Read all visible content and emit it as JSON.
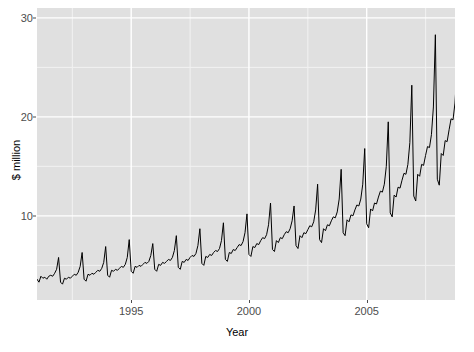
{
  "chart_data": {
    "type": "line",
    "title": "",
    "subtitle": "",
    "xlabel": "Year",
    "ylabel": "$ million",
    "xlim": [
      1991.0,
      2008.75
    ],
    "ylim": [
      1.5,
      31.0
    ],
    "xticks": [
      1995,
      2000,
      2005
    ],
    "xtick_labels": [
      "1995",
      "2000",
      "2005"
    ],
    "yticks": [
      10,
      20,
      30
    ],
    "ytick_labels": [
      "10",
      "20",
      "30"
    ],
    "grid": true,
    "grid_major_color": "#ffffff",
    "grid_minor_color": "#f2f2f2",
    "panel_background": "#e0e0e0",
    "line_color": "#000000",
    "line_width": 1.0,
    "legend": "none",
    "series": [
      {
        "name": "monthly total",
        "x_start": 1991.0,
        "x_step": 0.08333,
        "values": [
          3.6,
          3.3,
          3.9,
          3.7,
          3.8,
          3.6,
          3.9,
          4.0,
          3.9,
          4.2,
          4.6,
          5.8,
          3.3,
          3.1,
          3.7,
          3.6,
          3.8,
          3.7,
          3.9,
          4.1,
          4.0,
          4.3,
          4.9,
          6.3,
          3.6,
          3.4,
          4.1,
          4.0,
          4.2,
          4.1,
          4.3,
          4.5,
          4.4,
          4.7,
          5.3,
          6.9,
          4.0,
          3.8,
          4.5,
          4.4,
          4.6,
          4.5,
          4.7,
          4.9,
          4.8,
          5.1,
          5.8,
          7.6,
          4.4,
          4.2,
          4.9,
          4.8,
          5.0,
          4.9,
          5.1,
          5.3,
          5.2,
          5.4,
          6.0,
          7.2,
          4.6,
          4.4,
          5.1,
          5.0,
          5.3,
          5.2,
          5.4,
          5.6,
          5.5,
          5.8,
          6.5,
          8.0,
          4.8,
          4.6,
          5.4,
          5.3,
          5.6,
          5.5,
          5.8,
          6.0,
          5.9,
          6.2,
          7.0,
          8.7,
          5.2,
          5.0,
          5.9,
          5.8,
          6.1,
          6.0,
          6.3,
          6.5,
          6.4,
          6.7,
          7.5,
          9.3,
          5.6,
          5.4,
          6.3,
          6.2,
          6.6,
          6.5,
          6.8,
          7.1,
          7.0,
          7.4,
          8.3,
          10.2,
          6.1,
          5.9,
          6.9,
          6.8,
          7.2,
          7.1,
          7.5,
          7.8,
          7.7,
          8.1,
          9.1,
          11.3,
          6.6,
          6.4,
          7.5,
          7.3,
          7.8,
          7.7,
          8.1,
          8.4,
          8.3,
          8.7,
          9.5,
          11.0,
          7.0,
          6.7,
          8.0,
          7.8,
          8.3,
          8.2,
          8.6,
          9.0,
          8.9,
          9.4,
          10.6,
          13.2,
          7.6,
          7.3,
          8.7,
          8.5,
          9.1,
          9.0,
          9.5,
          9.9,
          9.8,
          10.4,
          11.7,
          14.7,
          8.3,
          8.0,
          9.6,
          9.4,
          10.1,
          10.0,
          10.6,
          11.1,
          11.0,
          11.7,
          13.2,
          16.8,
          9.2,
          8.8,
          10.7,
          10.5,
          11.3,
          11.2,
          11.9,
          12.5,
          12.4,
          13.2,
          15.0,
          19.5,
          10.3,
          9.9,
          12.1,
          11.9,
          12.9,
          12.8,
          13.6,
          14.3,
          14.2,
          15.2,
          17.4,
          23.2,
          12.0,
          11.5,
          14.2,
          14.0,
          15.2,
          15.1,
          16.1,
          17.0,
          16.9,
          18.2,
          21.0,
          28.3,
          13.7,
          13.1,
          16.3,
          16.1,
          17.6,
          17.5,
          18.7,
          19.8,
          19.7,
          21.4,
          24.8,
          29.9,
          15.0,
          14.3,
          18.0,
          19.8,
          19.9,
          19.6
        ]
      }
    ]
  },
  "axis": {
    "ylabel_text": "$ million",
    "xlabel_text": "Year"
  }
}
